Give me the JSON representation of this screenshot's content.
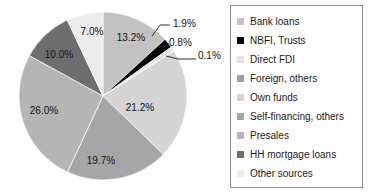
{
  "chart_data": {
    "type": "pie",
    "title": "",
    "legend_position": "right",
    "categories": [
      "Bank loans",
      "NBFI, Trusts",
      "Direct FDI",
      "Foreign, others",
      "Own funds",
      "Self-financing, others",
      "Presales",
      "HH mortgage loans",
      "Other sources"
    ],
    "values": [
      13.2,
      1.9,
      0.8,
      0.1,
      21.2,
      19.7,
      26.0,
      10.0,
      7.0
    ],
    "value_labels": [
      "13.2%",
      "1.9%",
      "0.8%",
      "0.1%",
      "21.2%",
      "19.7%",
      "26.0%",
      "10.0%",
      "7.0%"
    ],
    "colors": [
      "#c2c2c2",
      "#000000",
      "#e3e3e3",
      "#9e9e9e",
      "#d5d5d5",
      "#a6a6a6",
      "#b5b5b5",
      "#6e6e6e",
      "#ececec"
    ],
    "units": "percent",
    "start_angle_deg": 0,
    "direction": "clockwise"
  },
  "pie": {
    "labels": {
      "bank_loans": "13.2%",
      "nbfi_trusts": "1.9%",
      "direct_fdi": "0.8%",
      "foreign_others": "0.1%",
      "own_funds": "21.2%",
      "self_financing": "19.7%",
      "presales": "26.0%",
      "hh_mortgage": "10.0%",
      "other_sources": "7.0%"
    }
  },
  "legend": {
    "items": [
      {
        "label": "Bank loans",
        "color": "#c2c2c2"
      },
      {
        "label": "NBFI, Trusts",
        "color": "#000000"
      },
      {
        "label": "Direct FDI",
        "color": "#e3e3e3"
      },
      {
        "label": "Foreign, others",
        "color": "#9e9e9e"
      },
      {
        "label": "Own funds",
        "color": "#d5d5d5"
      },
      {
        "label": "Self-financing, others",
        "color": "#a6a6a6"
      },
      {
        "label": "Presales",
        "color": "#b5b5b5"
      },
      {
        "label": "HH mortgage loans",
        "color": "#6e6e6e"
      },
      {
        "label": "Other sources",
        "color": "#ececec"
      }
    ]
  }
}
